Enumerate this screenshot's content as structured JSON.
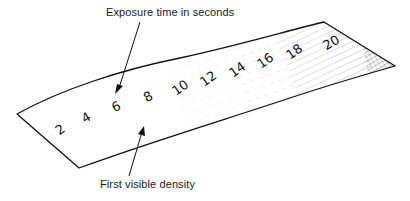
{
  "figure": {
    "type": "test-strip illustration",
    "annotations": {
      "top": "Exposure time in seconds",
      "bottom": "First visible density"
    },
    "strip": {
      "exposure_labels": [
        "2",
        "4",
        "6",
        "8",
        "10",
        "12",
        "14",
        "16",
        "18",
        "20"
      ],
      "unit": "seconds",
      "first_visible_density_at": "6"
    },
    "colors": {
      "ink": "#111111",
      "background": "#ffffff",
      "shading": "#555555"
    }
  }
}
